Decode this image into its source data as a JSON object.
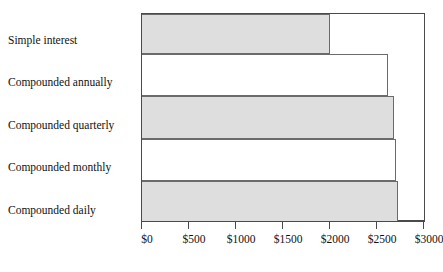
{
  "chart_data": {
    "type": "bar",
    "orientation": "horizontal",
    "title": "",
    "xlabel": "",
    "ylabel": "",
    "categories": [
      "Simple interest",
      "Compounded annually",
      "Compounded quarterly",
      "Compounded monthly",
      "Compounded daily"
    ],
    "values": [
      2000,
      2620,
      2680,
      2700,
      2725
    ],
    "bar_styles": [
      "shaded",
      "plain",
      "shaded",
      "plain",
      "shaded"
    ],
    "xlim": [
      0,
      3000
    ],
    "xticks": [
      0,
      500,
      1000,
      1500,
      2000,
      2500,
      3000
    ],
    "xtick_labels": [
      "$0",
      "$500",
      "$1000",
      "$1500",
      "$2000",
      "$2500",
      "$3000"
    ],
    "grid": false,
    "legend": false,
    "colors": {
      "bar_fill_shaded": "#dedede",
      "bar_fill_plain": "#ffffff",
      "bar_edge": "#6b6b6b",
      "axis": "#4a4a4a",
      "text": "#111111",
      "background": "#ffffff"
    }
  }
}
